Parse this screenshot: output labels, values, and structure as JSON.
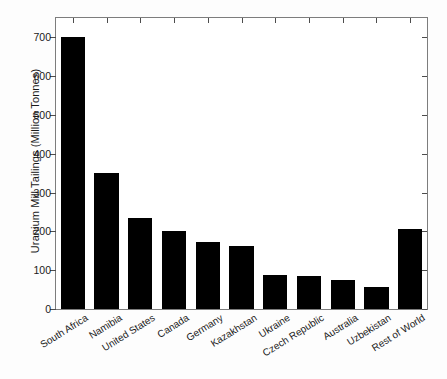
{
  "chart_data": {
    "type": "bar",
    "title": "",
    "subtitle": "",
    "xlabel": "",
    "ylabel": "Uranium Mill Tailings (Million Tonnes)",
    "categories": [
      "South Africa",
      "Namibia",
      "United States",
      "Canada",
      "Germany",
      "Kazakhstan",
      "Ukraine",
      "Czech Republic",
      "Australia",
      "Uzbekistan",
      "Rest of World"
    ],
    "values": [
      700,
      350,
      234,
      201,
      173,
      163,
      88,
      86,
      75,
      57,
      205
    ],
    "ylim": [
      0,
      750
    ],
    "yticks": [
      0,
      100,
      200,
      300,
      400,
      500,
      600,
      700
    ],
    "ytick_labels": [
      "0",
      "100",
      "200",
      "300",
      "400",
      "500",
      "600",
      "700"
    ],
    "grid": false,
    "legend": "none",
    "bar_color": "#000000",
    "axis_color": "#7d7d7d",
    "background_color": "#ffffff"
  }
}
